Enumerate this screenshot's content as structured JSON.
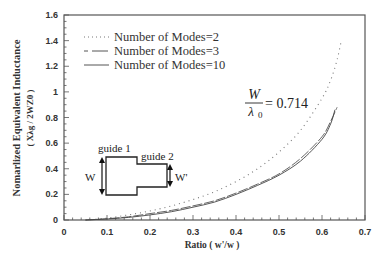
{
  "chart_data": {
    "type": "line",
    "title": "",
    "xlabel": "Ratio  ( w'/w )",
    "ylabel": "Nomarlized Equivalent Inductance",
    "ylabel_sub": "( Xλg / 2WZ0 )",
    "xlim": [
      0,
      0.7
    ],
    "ylim": [
      0,
      1.6
    ],
    "x_ticks": [
      "0",
      "0.1",
      "0.2",
      "0.3",
      "0.4",
      "0.5",
      "0.6",
      "0.7"
    ],
    "y_ticks": [
      "0",
      "0.2",
      "0.4",
      "0.6",
      "0.8",
      "1",
      "1.2",
      "1.4",
      "1.6"
    ],
    "grid": false,
    "legend_position": "upper-left",
    "series": [
      {
        "name": "Number of Modes=2",
        "style": "dotted",
        "x": [
          0.05,
          0.1,
          0.15,
          0.2,
          0.25,
          0.3,
          0.35,
          0.4,
          0.45,
          0.5,
          0.55,
          0.6,
          0.62,
          0.635,
          0.645
        ],
        "y": [
          0.0,
          0.015,
          0.04,
          0.07,
          0.11,
          0.16,
          0.22,
          0.3,
          0.4,
          0.53,
          0.7,
          0.95,
          1.09,
          1.25,
          1.4
        ]
      },
      {
        "name": "Number of Modes=3",
        "style": "dashed",
        "x": [
          0.05,
          0.1,
          0.15,
          0.2,
          0.25,
          0.3,
          0.35,
          0.4,
          0.45,
          0.5,
          0.55,
          0.6,
          0.62,
          0.635
        ],
        "y": [
          0.0,
          0.01,
          0.025,
          0.05,
          0.075,
          0.11,
          0.15,
          0.21,
          0.28,
          0.36,
          0.48,
          0.65,
          0.77,
          0.88
        ]
      },
      {
        "name": "Number of Modes=10",
        "style": "solid",
        "x": [
          0.05,
          0.1,
          0.15,
          0.2,
          0.25,
          0.3,
          0.35,
          0.4,
          0.45,
          0.5,
          0.55,
          0.6,
          0.62,
          0.63
        ],
        "y": [
          0.0,
          0.008,
          0.02,
          0.04,
          0.065,
          0.1,
          0.14,
          0.2,
          0.27,
          0.35,
          0.46,
          0.63,
          0.75,
          0.86
        ]
      }
    ],
    "annotations": {
      "formula_numerator": "W",
      "formula_denominator": "λ",
      "formula_denominator_sub": "0",
      "formula_value": "= 0.714",
      "diagram_guide1": "guide 1",
      "diagram_guide2": "guide 2",
      "diagram_w": "W",
      "diagram_w_prime": "W'"
    }
  },
  "colors": {
    "axis": "#555555",
    "curve": "#444444",
    "background": "#ffffff"
  }
}
